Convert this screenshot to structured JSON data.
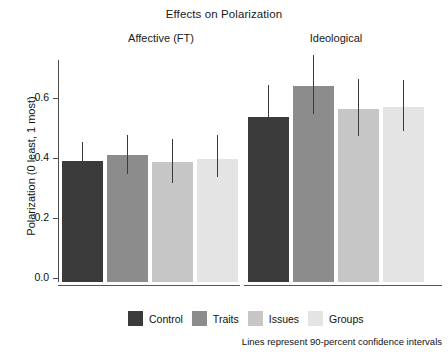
{
  "chart_data": {
    "type": "bar",
    "title": "Effects on Polarization",
    "xlabel": "",
    "ylabel": "Polarization (0 least, 1 most)",
    "ylim": [
      0.0,
      0.72
    ],
    "yticks": [
      "0.0",
      "0.2",
      "0.4",
      "0.6"
    ],
    "ytick_values": [
      0.0,
      0.2,
      0.4,
      0.6
    ],
    "grid": false,
    "legend_position": "bottom",
    "panels": [
      {
        "label": "Affective (FT)",
        "categories": [
          "Control",
          "Traits",
          "Issues",
          "Groups"
        ],
        "values": [
          0.39,
          0.41,
          0.387,
          0.397
        ],
        "ci_low": [
          0.325,
          0.345,
          0.315,
          0.337
        ],
        "ci_high": [
          0.455,
          0.478,
          0.463,
          0.478
        ]
      },
      {
        "label": "Ideological",
        "categories": [
          "Control",
          "Traits",
          "Issues",
          "Groups"
        ],
        "values": [
          0.537,
          0.64,
          0.563,
          0.57
        ],
        "ci_low": [
          0.437,
          0.547,
          0.473,
          0.49
        ],
        "ci_high": [
          0.643,
          0.742,
          0.662,
          0.66
        ]
      }
    ],
    "series_colors": [
      "#3b3b3b",
      "#8c8c8c",
      "#c6c6c6",
      "#e4e4e4"
    ],
    "legend": [
      {
        "label": "Control",
        "color": "#3b3b3b"
      },
      {
        "label": "Traits",
        "color": "#8c8c8c"
      },
      {
        "label": "Issues",
        "color": "#c6c6c6"
      },
      {
        "label": "Groups",
        "color": "#e4e4e4"
      }
    ],
    "note": "Lines represent 90-percent confidence intervals"
  },
  "figure": {
    "title": "Effects on Polarization",
    "panel_affective": "Affective (FT)",
    "panel_ideological": "Ideological",
    "y_axis_label": "Polarization (0 least, 1 most)",
    "y_tick_0": "0.0",
    "y_tick_1": "0.2",
    "y_tick_2": "0.4",
    "y_tick_3": "0.6",
    "legend_control": "Control",
    "legend_traits": "Traits",
    "legend_issues": "Issues",
    "legend_groups": "Groups",
    "note": "Lines represent 90-percent confidence intervals"
  }
}
